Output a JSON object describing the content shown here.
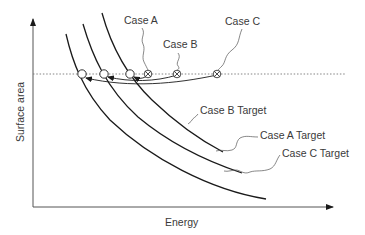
{
  "figure": {
    "type": "diagram",
    "axes": {
      "x_label": "Energy",
      "y_label": "Surface area"
    },
    "reference_line": {
      "style": "dotted",
      "meaning": "constant surface area level"
    },
    "cases": [
      {
        "label": "Case A",
        "marker": "crossed-circle"
      },
      {
        "label": "Case B",
        "marker": "crossed-circle"
      },
      {
        "label": "Case C",
        "marker": "crossed-circle"
      }
    ],
    "targets": [
      {
        "label": "Case B Target"
      },
      {
        "label": "Case A Target"
      },
      {
        "label": "Case C Target"
      }
    ],
    "target_points": [
      {
        "marker": "open-circle",
        "curve": "Case C Target"
      },
      {
        "marker": "open-circle",
        "curve": "Case A Target"
      },
      {
        "marker": "open-circle",
        "curve": "Case B Target"
      }
    ],
    "colors": {
      "line": "#1a1a1a",
      "text": "#3a3a3a",
      "dotted": "#777777",
      "background": "#ffffff"
    }
  }
}
